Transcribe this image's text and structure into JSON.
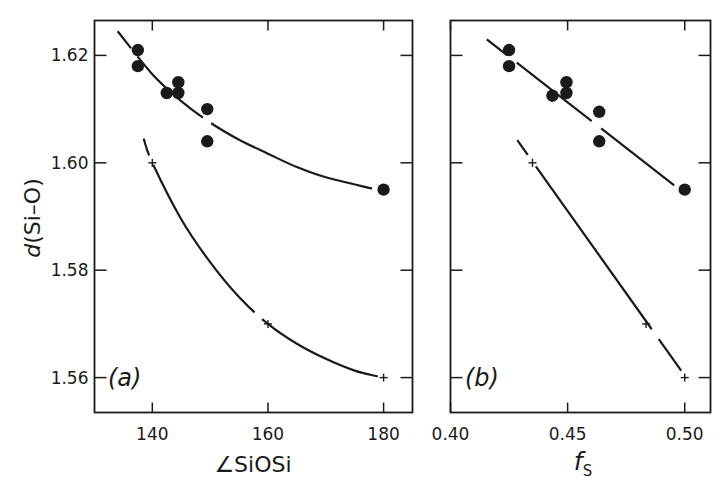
{
  "chart_data": [
    {
      "type": "scatter",
      "panel_label": "(a)",
      "xlabel": "∠SiOSi",
      "ylabel": "d(Si–O)",
      "xlim": [
        130,
        185
      ],
      "ylim": [
        1.5535,
        1.6265
      ],
      "xticks": [
        140,
        160,
        180
      ],
      "xtick_labels": [
        "140",
        "160",
        "180"
      ],
      "yticks": [
        1.56,
        1.58,
        1.6,
        1.62
      ],
      "ytick_labels": [
        "1.56",
        "1.58",
        "1.60",
        "1.62"
      ],
      "grid": false,
      "legend": null,
      "series": [
        {
          "name": "observed",
          "marker": "filled-circle",
          "points": [
            [
              137.5,
              1.621
            ],
            [
              137.5,
              1.618
            ],
            [
              142.5,
              1.613
            ],
            [
              144.5,
              1.613
            ],
            [
              144.5,
              1.615
            ],
            [
              149.5,
              1.61
            ],
            [
              149.5,
              1.604
            ],
            [
              180,
              1.595
            ]
          ]
        },
        {
          "name": "observed-fit",
          "marker": "none",
          "line": "dashed-curve",
          "points": [
            [
              134,
              1.6245
            ],
            [
              140,
              1.6165
            ],
            [
              145,
              1.6115
            ],
            [
              150,
              1.6075
            ],
            [
              155,
              1.6043
            ],
            [
              160,
              1.6017
            ],
            [
              165,
              1.5992
            ],
            [
              170,
              1.5973
            ],
            [
              178,
              1.5952
            ]
          ]
        },
        {
          "name": "calculated",
          "marker": "plus",
          "points": [
            [
              140,
              1.6
            ],
            [
              160,
              1.57
            ],
            [
              180,
              1.56
            ]
          ]
        },
        {
          "name": "calculated-fit",
          "marker": "none",
          "line": "dashed-curve",
          "points": [
            [
              138.5,
              1.6045
            ],
            [
              140,
              1.6
            ],
            [
              145,
              1.5895
            ],
            [
              150,
              1.5815
            ],
            [
              155,
              1.575
            ],
            [
              160,
              1.57
            ],
            [
              165,
              1.5663
            ],
            [
              170,
              1.5635
            ],
            [
              175,
              1.5613
            ],
            [
              179,
              1.5602
            ]
          ]
        }
      ]
    },
    {
      "type": "scatter",
      "panel_label": "(b)",
      "xlabel": "f",
      "xlabel_subscript": "S",
      "ylabel": "",
      "xlim": [
        0.4,
        0.511
      ],
      "ylim": [
        1.5535,
        1.6265
      ],
      "xticks": [
        0.4,
        0.45,
        0.5
      ],
      "xtick_labels": [
        "0.40",
        "0.45",
        "0.50"
      ],
      "yticks": [
        1.56,
        1.58,
        1.6,
        1.62
      ],
      "ytick_labels": [],
      "grid": false,
      "legend": null,
      "series": [
        {
          "name": "observed",
          "marker": "filled-circle",
          "points": [
            [
              0.425,
              1.621
            ],
            [
              0.425,
              1.618
            ],
            [
              0.4435,
              1.6125
            ],
            [
              0.4495,
              1.615
            ],
            [
              0.4495,
              1.613
            ],
            [
              0.4635,
              1.6095
            ],
            [
              0.4635,
              1.604
            ],
            [
              0.5,
              1.595
            ]
          ]
        },
        {
          "name": "observed-fit",
          "marker": "none",
          "line": "dashed-straight",
          "points": [
            [
              0.4155,
              1.623
            ],
            [
              0.4955,
              1.5958
            ]
          ]
        },
        {
          "name": "calculated",
          "marker": "plus",
          "points": [
            [
              0.435,
              1.6
            ],
            [
              0.4835,
              1.57
            ],
            [
              0.5,
              1.56
            ]
          ]
        },
        {
          "name": "calculated-fit",
          "marker": "none",
          "line": "dashed-straight",
          "points": [
            [
              0.4285,
              1.6042
            ],
            [
              0.4985,
              1.5613
            ]
          ]
        }
      ]
    }
  ],
  "panels": [
    {
      "label": "(a)",
      "xlabel": "∠SiOSi"
    },
    {
      "label": "(b)",
      "xlabel": "f",
      "xlabel_sub": "S"
    }
  ],
  "yaxis_title": "d(Si–O)"
}
